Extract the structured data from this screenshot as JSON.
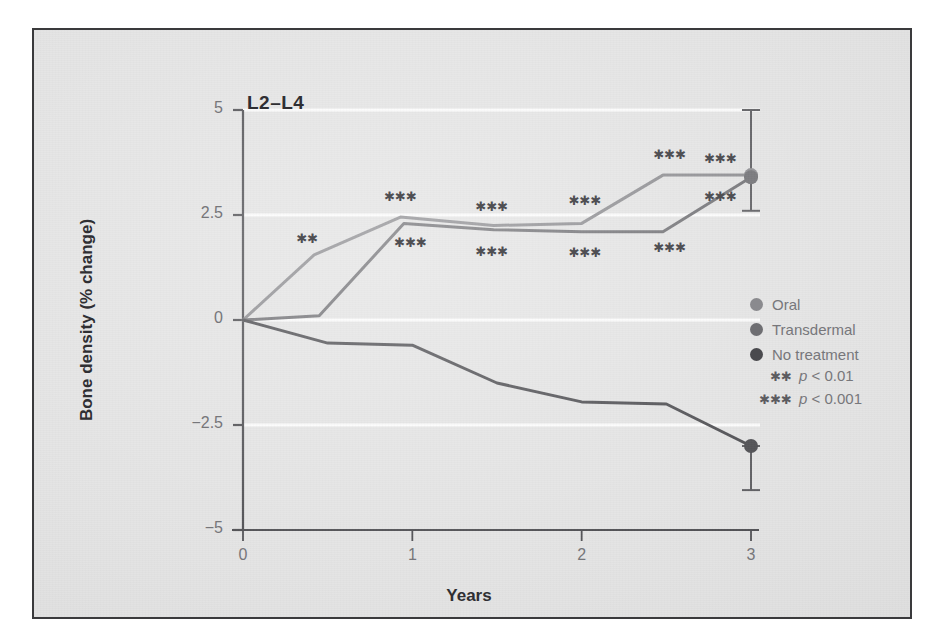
{
  "figure": {
    "panel_title": "L2–L4",
    "background_color": "#e3e3e3",
    "border_color": "#3a3a3c"
  },
  "axes": {
    "x_label": "Years",
    "y_label": "Bone density (% change)",
    "x_ticks": [
      "0",
      "1",
      "2",
      "3"
    ],
    "y_ticks": [
      "5",
      "2.5",
      "0",
      "−2.5",
      "−5"
    ]
  },
  "legend": {
    "series": [
      {
        "label": "Oral",
        "color": "#8a8a8e",
        "dot": "legend-dot-oral"
      },
      {
        "label": "Transdermal",
        "color": "#6e6e72",
        "dot": "legend-dot-transdermal"
      },
      {
        "label": "No treatment",
        "color": "#4a4a4e",
        "dot": "legend-dot-no-treatment"
      }
    ],
    "notes": [
      {
        "stars": "✱✱",
        "text_prefix": "p",
        "text_suffix": " < 0.01"
      },
      {
        "stars": "✱✱✱",
        "text_prefix": "p",
        "text_suffix": " < 0.001"
      }
    ]
  },
  "chart_data": {
    "type": "line",
    "title": "L2–L4",
    "xlabel": "Years",
    "ylabel": "Bone density (% change)",
    "xlim": [
      -0.12,
      3.0
    ],
    "ylim": [
      -5,
      5
    ],
    "x_ticks": [
      0,
      1,
      2,
      3
    ],
    "y_ticks": [
      5,
      2.5,
      0,
      -2.5,
      -5
    ],
    "grid": "horizontal white gridlines at 5, 2.5, 0, -2.5",
    "legend_position": "right-outside",
    "series": [
      {
        "name": "Oral",
        "color": "#8a8a8e",
        "x": [
          0,
          0.42,
          0.93,
          1.48,
          2.0,
          2.48,
          3.0
        ],
        "y": [
          0,
          1.55,
          2.45,
          2.25,
          2.3,
          3.45,
          3.45
        ],
        "endpoint_marker": true,
        "error_bar": {
          "x": 3.0,
          "y": 3.45,
          "low": 2.6,
          "high": 5.0
        }
      },
      {
        "name": "Transdermal",
        "color": "#6e6e72",
        "x": [
          0,
          0.45,
          0.95,
          1.48,
          2.0,
          2.48,
          3.0
        ],
        "y": [
          0,
          0.1,
          2.3,
          2.15,
          2.1,
          2.1,
          3.4
        ],
        "endpoint_marker": true,
        "error_bar": null
      },
      {
        "name": "No treatment",
        "color": "#4a4a4e",
        "x": [
          0,
          0.5,
          1.0,
          1.5,
          2.0,
          2.5,
          3.0
        ],
        "y": [
          0,
          -0.55,
          -0.6,
          -1.5,
          -1.95,
          -2.0,
          -3.0
        ],
        "endpoint_marker": true,
        "error_bar": {
          "x": 3.0,
          "y": -3.0,
          "low": -4.05,
          "high": -3.0
        }
      }
    ],
    "significance_marks": [
      {
        "x": 0.38,
        "y": 1.95,
        "stars": "✱✱",
        "series": "Oral"
      },
      {
        "x": 0.93,
        "y": 2.95,
        "stars": "✱✱✱",
        "series": "Oral"
      },
      {
        "x": 0.99,
        "y": 1.85,
        "stars": "✱✱✱",
        "series": "Transdermal"
      },
      {
        "x": 1.47,
        "y": 2.72,
        "stars": "✱✱✱",
        "series": "Oral"
      },
      {
        "x": 1.47,
        "y": 1.65,
        "stars": "✱✱✱",
        "series": "Transdermal"
      },
      {
        "x": 2.02,
        "y": 2.85,
        "stars": "✱✱✱",
        "series": "Oral"
      },
      {
        "x": 2.02,
        "y": 1.62,
        "stars": "✱✱✱",
        "series": "Transdermal"
      },
      {
        "x": 2.52,
        "y": 3.95,
        "stars": "✱✱✱",
        "series": "Oral"
      },
      {
        "x": 2.52,
        "y": 1.75,
        "stars": "✱✱✱",
        "series": "Transdermal"
      },
      {
        "x": 2.82,
        "y": 3.85,
        "stars": "✱✱✱",
        "series": "Oral"
      },
      {
        "x": 2.82,
        "y": 2.95,
        "stars": "✱✱✱",
        "series": "Transdermal"
      }
    ]
  }
}
